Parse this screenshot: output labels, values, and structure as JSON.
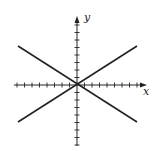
{
  "diagram": {
    "title_fragment": "y)",
    "x_axis_label": "x",
    "y_axis_label": "y",
    "origin": [
      77,
      85
    ],
    "x_axis": {
      "from": 14,
      "to": 147,
      "ticks_each_side": 8,
      "tick_spacing": 7.5
    },
    "y_axis": {
      "from": 146,
      "to": 16,
      "ticks_each_side": 8,
      "tick_spacing": 7.5
    },
    "lines": [
      {
        "name": "line-positive-slope",
        "from": [
          18,
          122
        ],
        "to": [
          137,
          46
        ]
      },
      {
        "name": "line-negative-slope",
        "from": [
          18,
          46
        ],
        "to": [
          137,
          122
        ]
      }
    ],
    "colors": {
      "axis": "#222222",
      "line": "#222222",
      "background": "#ffffff"
    }
  }
}
